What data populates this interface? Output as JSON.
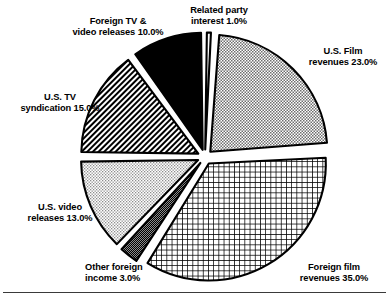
{
  "chart_data": {
    "type": "pie",
    "title": "",
    "subtitle": "",
    "xlabel": "",
    "ylabel": "",
    "legend_position": "none",
    "grid": false,
    "units": "percent",
    "start_angle_deg": 0,
    "direction": "clockwise",
    "exploded": true,
    "categories": [
      "Related party interest",
      "U.S. Film revenues",
      "Foreign film revenues",
      "Other foreign income",
      "U.S. video releases",
      "U.S. TV syndication",
      "Foreign TV & video releases"
    ],
    "values": [
      1.0,
      23.0,
      35.0,
      3.0,
      13.0,
      15.0,
      10.0
    ],
    "slices": [
      {
        "name": "related-party-interest",
        "label_line1": "Related party",
        "label_line2": "interest 1.0%",
        "value": 1.0,
        "value_text": "1.0%",
        "fill": "white",
        "color": "#ffffff"
      },
      {
        "name": "us-film-revenues",
        "label_line1": "U.S. Film",
        "label_line2": "revenues 23.0%",
        "value": 23.0,
        "value_text": "23.0%",
        "fill": "fine-stipple",
        "color": "#b4b4b4"
      },
      {
        "name": "foreign-film-revenues",
        "label_line1": "Foreign film",
        "label_line2": "revenues 35.0%",
        "value": 35.0,
        "value_text": "35.0%",
        "fill": "cross-hatch-grid",
        "color": "#000000"
      },
      {
        "name": "other-foreign-income",
        "label_line1": "Other foreign",
        "label_line2": "income 3.0%",
        "value": 3.0,
        "value_text": "3.0%",
        "fill": "dark-dense-checker",
        "color": "#303030"
      },
      {
        "name": "us-video-releases",
        "label_line1": "U.S. video",
        "label_line2": "releases 13.0%",
        "value": 13.0,
        "value_text": "13.0%",
        "fill": "light-stipple",
        "color": "#c8c8c8"
      },
      {
        "name": "us-tv-syndication",
        "label_line1": "U.S. TV",
        "label_line2": "syndication 15.0%",
        "value": 15.0,
        "value_text": "15.0%",
        "fill": "diagonal-stripes",
        "color": "#000000"
      },
      {
        "name": "foreign-tv-video-releases",
        "label_line1": "Foreign TV &",
        "label_line2": "video releases 10.0%",
        "value": 10.0,
        "value_text": "10.0%",
        "fill": "solid-black",
        "color": "#000000"
      }
    ]
  }
}
